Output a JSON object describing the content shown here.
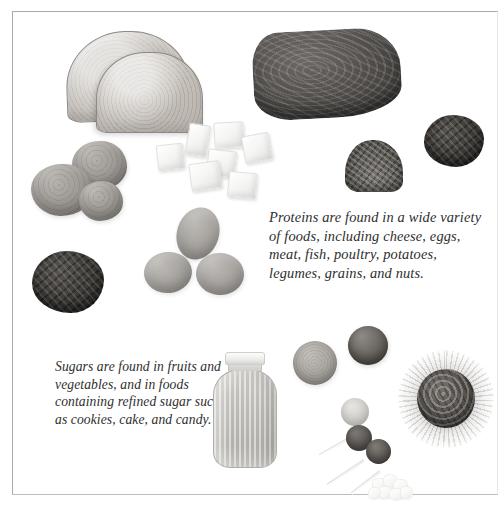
{
  "page": {
    "background_color": "#ffffff",
    "frame_color": "#a9a9a9",
    "width": 504,
    "height": 508
  },
  "captions": {
    "proteins": {
      "text": "Proteins are found in a wide variety of foods, including cheese, eggs, meat, fish, poultry, potatoes, legumes, grains, and nuts.",
      "style": "italic-serif",
      "color": "#2e2e2e"
    },
    "sugars": {
      "text": "Sugars are found in fruits and vegetables, and in foods containing refined sugar such as cookies, cake, and candy.",
      "style": "italic-serif",
      "color": "#2e2e2e"
    }
  },
  "food_items": {
    "bread_back": {
      "label": "bread slice"
    },
    "bread_front": {
      "label": "bread slice"
    },
    "meat": {
      "label": "meat steak"
    },
    "potatoes": [
      {
        "label": "potato"
      },
      {
        "label": "potato"
      },
      {
        "label": "potato"
      }
    ],
    "sugar_cubes": [
      {
        "label": "sugar cube"
      },
      {
        "label": "sugar cube"
      },
      {
        "label": "sugar cube"
      },
      {
        "label": "sugar cube"
      },
      {
        "label": "sugar cube"
      },
      {
        "label": "sugar cube"
      },
      {
        "label": "sugar cube"
      }
    ],
    "eggs": [
      {
        "label": "egg"
      },
      {
        "label": "egg"
      },
      {
        "label": "egg"
      }
    ],
    "legumes_left": {
      "label": "legumes cluster"
    },
    "legumes_right": {
      "label": "legumes cluster"
    },
    "nuts": {
      "label": "chopped nuts"
    },
    "honey_jar": {
      "label": "honey jar"
    },
    "orange": {
      "label": "orange fruit"
    },
    "apple": {
      "label": "apple fruit"
    },
    "lollipops": [
      {
        "label": "lollipop"
      },
      {
        "label": "lollipop"
      },
      {
        "label": "lollipop"
      }
    ],
    "cake": {
      "label": "cake on doily"
    },
    "candies": {
      "label": "candy pieces"
    }
  }
}
